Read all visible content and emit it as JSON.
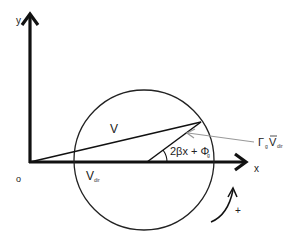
{
  "diagram": {
    "type": "phasor-circle",
    "axes": {
      "y_label": "y",
      "x_label": "x",
      "origin_label": "o"
    },
    "labels": {
      "v": "V",
      "v_dir_main": "V",
      "v_dir_sub": "dir",
      "angle_main": "2βx + Φ",
      "angle_sub": "g",
      "gamma_main": "Γ",
      "gamma_sub": "g",
      "gamma_v": "V",
      "gamma_v_sub": "dir",
      "rotation_sign": "+"
    },
    "colors": {
      "stroke": "#1a1a1a",
      "pointer": "#999999",
      "background": "#ffffff"
    }
  }
}
